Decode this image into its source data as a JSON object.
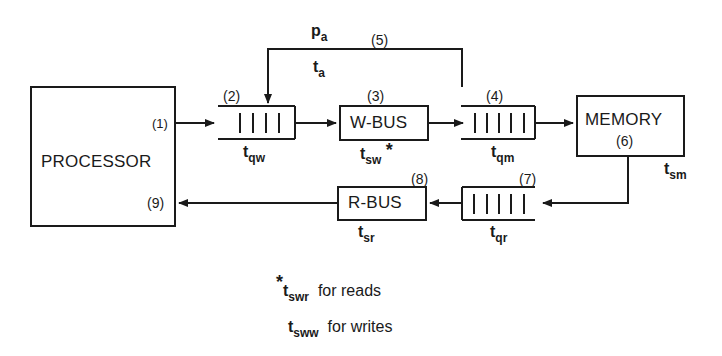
{
  "diagram": {
    "type": "queueing-model",
    "nodes": {
      "processor": {
        "label": "PROCESSOR"
      },
      "write_queue": {
        "number": "(2)",
        "time_base": "t",
        "time_sub": "qw",
        "bars": 4
      },
      "write_bus": {
        "label": "W-BUS",
        "number": "(3)",
        "time_base": "t",
        "time_sub": "sw",
        "marker": "*"
      },
      "memory_queue": {
        "number": "(4)",
        "time_base": "t",
        "time_sub": "qm",
        "bars": 5
      },
      "memory": {
        "label": "MEMORY",
        "number": "(6)",
        "time_base": "t",
        "time_sub": "sm"
      },
      "read_queue": {
        "number": "(7)",
        "time_base": "t",
        "time_sub": "qr",
        "bars": 5
      },
      "read_bus": {
        "label": "R-BUS",
        "number": "(8)",
        "time_base": "t",
        "time_sub": "sr"
      }
    },
    "edges": {
      "processor_out": {
        "number": "(1)"
      },
      "feedback": {
        "number": "(5)",
        "prob_base": "p",
        "prob_sub": "a",
        "time_base": "t",
        "time_sub": "a"
      },
      "processor_in": {
        "number": "(9)"
      }
    },
    "footnote": {
      "marker": "*",
      "lines": [
        {
          "base": "t",
          "sub": "swr",
          "text": "for reads"
        },
        {
          "base": "t",
          "sub": "sww",
          "text": "for writes"
        }
      ]
    }
  }
}
